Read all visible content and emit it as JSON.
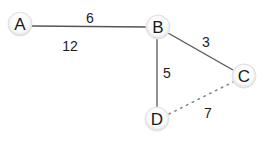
{
  "graph": {
    "nodes": [
      {
        "id": "A",
        "label": "A",
        "x": 20,
        "y": 24
      },
      {
        "id": "B",
        "label": "B",
        "x": 158,
        "y": 27
      },
      {
        "id": "C",
        "label": "C",
        "x": 244,
        "y": 76
      },
      {
        "id": "D",
        "label": "D",
        "x": 157,
        "y": 119
      }
    ],
    "edges": [
      {
        "from": "A",
        "to": "B",
        "weight": "6",
        "style": "solid",
        "label_x": 90,
        "label_y": 23
      },
      {
        "from": "B",
        "to": "C",
        "weight": "3",
        "style": "solid",
        "label_x": 206,
        "label_y": 47
      },
      {
        "from": "B",
        "to": "D",
        "weight": "5",
        "style": "solid",
        "label_x": 167,
        "label_y": 78
      },
      {
        "from": "D",
        "to": "C",
        "weight": "7",
        "style": "dotted",
        "label_x": 208,
        "label_y": 118
      }
    ],
    "floating_labels": [
      {
        "text": "12",
        "x": 70,
        "y": 51
      }
    ]
  },
  "colors": {
    "edge": "#555555",
    "dotted_edge": "#888888",
    "node_fill": "#ffffff",
    "node_shadow": "#d8d8d8",
    "text": "#1a1a1a"
  }
}
